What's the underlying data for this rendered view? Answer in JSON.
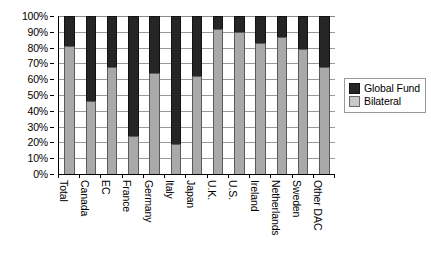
{
  "chart_data": {
    "type": "bar",
    "subtype": "stacked-100-percent",
    "title": "",
    "xlabel": "",
    "ylabel": "",
    "ylim": [
      0,
      100
    ],
    "ytick_labels": [
      "100%",
      "90%",
      "80%",
      "70%",
      "60%",
      "50%",
      "40%",
      "30%",
      "20%",
      "10%",
      "0%"
    ],
    "ytick_values": [
      100,
      90,
      80,
      70,
      60,
      50,
      40,
      30,
      20,
      10,
      0
    ],
    "grid": true,
    "legend_position": "right",
    "categories": [
      "Total",
      "Canada",
      "EC",
      "France",
      "Germany",
      "Italy",
      "Japan",
      "U.K.",
      "U.S.",
      "Ireland",
      "Netherlands",
      "Sweden",
      "Other DAC"
    ],
    "series": [
      {
        "name": "Bilateral",
        "color": "#a9a9a9",
        "values": [
          81,
          46,
          68,
          24,
          64,
          19,
          62,
          92,
          90,
          83,
          87,
          79,
          68
        ]
      },
      {
        "name": "Global Fund",
        "color": "#262626",
        "values": [
          19,
          54,
          32,
          76,
          36,
          81,
          38,
          8,
          10,
          17,
          13,
          21,
          32
        ]
      }
    ],
    "stack_order": [
      "Bilateral",
      "Global Fund"
    ]
  },
  "legend": {
    "items": [
      {
        "label": "Global Fund",
        "swatch": "global"
      },
      {
        "label": "Bilateral",
        "swatch": "bilateral"
      }
    ]
  }
}
